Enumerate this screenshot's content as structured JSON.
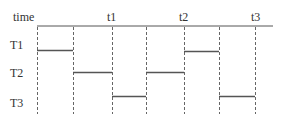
{
  "diagram": {
    "type": "timing-diagram",
    "axis_label": "time",
    "time_markers": [
      {
        "label": "t1",
        "x": 112
      },
      {
        "label": "t2",
        "x": 184
      },
      {
        "label": "t3",
        "x": 256
      }
    ],
    "rows": [
      {
        "label": "T1",
        "y": 51
      },
      {
        "label": "T2",
        "y": 72
      },
      {
        "label": "T3",
        "y": 97
      }
    ],
    "grid_x": [
      37,
      73,
      112,
      146,
      184,
      219,
      256
    ],
    "segments": [
      {
        "row": "T1",
        "x1": 37,
        "x2": 73
      },
      {
        "row": "T2",
        "x1": 73,
        "x2": 112
      },
      {
        "row": "T3",
        "x1": 112,
        "x2": 146
      },
      {
        "row": "T2",
        "x1": 146,
        "x2": 184
      },
      {
        "row": "T1",
        "x1": 184,
        "x2": 219
      },
      {
        "row": "T3",
        "x1": 219,
        "x2": 256
      }
    ],
    "colors": {
      "line": "#555555",
      "dash": "#666666",
      "text": "#333333"
    }
  }
}
